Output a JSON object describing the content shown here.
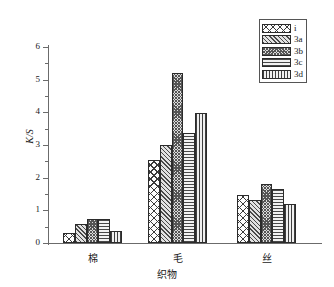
{
  "chart_data": {
    "type": "bar",
    "title": "",
    "subtitle": "",
    "xlabel": "织物",
    "ylabel": "K/S",
    "categories": [
      "棉",
      "毛",
      "丝"
    ],
    "series": [
      {
        "name": "i",
        "pattern": "cross-hatch",
        "values": [
          0.32,
          2.55,
          1.48
        ]
      },
      {
        "name": "3a",
        "pattern": "diagonal-hatch",
        "values": [
          0.58,
          2.99,
          1.32
        ]
      },
      {
        "name": "3b",
        "pattern": "dense-checker",
        "values": [
          0.75,
          5.21,
          1.8
        ]
      },
      {
        "name": "3c",
        "pattern": "horizontal-lines",
        "values": [
          0.72,
          3.38,
          1.66
        ]
      },
      {
        "name": "3d",
        "pattern": "vertical-lines",
        "values": [
          0.38,
          3.98,
          1.18
        ]
      }
    ],
    "ylim": [
      0,
      6
    ],
    "yticks": [
      0,
      1,
      2,
      3,
      4,
      5,
      6
    ],
    "yticks_minor": [
      0.5,
      1.5,
      2.5,
      3.5,
      4.5,
      5.5
    ],
    "ytick_labels": [
      "0",
      "1",
      "2",
      "3",
      "4",
      "5",
      "6"
    ],
    "grid": false,
    "legend_position": "top-right",
    "legend_entries": [
      "i",
      "3a",
      "3b",
      "3c",
      "3d"
    ],
    "colors": {
      "axis": "#6b6b6b",
      "bar_outline": "#2b2b2b",
      "hatch": "#3a3a3a",
      "text": "#1a1a1a",
      "background": "#ffffff"
    }
  }
}
